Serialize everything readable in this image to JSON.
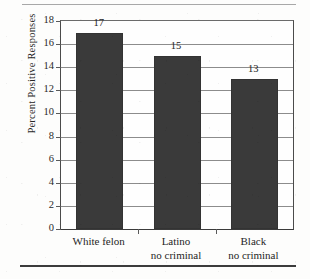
{
  "chart_data": {
    "type": "bar",
    "title": "",
    "xlabel": "",
    "ylabel": "Percent Positive Responses",
    "categories": [
      "White felon",
      "Latino no criminal",
      "Black no criminal"
    ],
    "category_lines": [
      [
        "White felon"
      ],
      [
        "Latino",
        "no criminal"
      ],
      [
        "Black",
        "no criminal"
      ]
    ],
    "values": [
      17,
      15,
      13
    ],
    "value_labels": [
      "17",
      "15",
      "13"
    ],
    "ylim": [
      0,
      18
    ],
    "ytick_step": 2,
    "yticks": [
      18,
      16,
      14,
      12,
      10,
      8,
      6,
      4,
      2,
      0
    ],
    "ytick_labels": [
      "18",
      "16",
      "14",
      "12",
      "10",
      "8",
      "6",
      "4",
      "2",
      "0"
    ],
    "grid": true,
    "grid_axis": "y",
    "legend": false,
    "legend_position": "none",
    "bar_color": "#3a3a3a",
    "grid_color": "#8c8c8c",
    "axis_color": "#3b3b3b",
    "plot_background": "#fefefe"
  },
  "figure": {
    "page_background": "#fdfdfc",
    "rule_top_color": "#a8a8a8",
    "rule_bottom_color": "#3c3c3c"
  }
}
